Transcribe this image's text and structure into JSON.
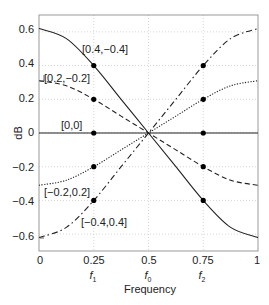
{
  "chart_data": {
    "type": "line",
    "title": "",
    "xlabel": "Frequency",
    "ylabel": "dB",
    "xlim": [
      0,
      1
    ],
    "ylim": [
      -0.7,
      0.7
    ],
    "grid": true,
    "x_ticks": [
      {
        "value": 0,
        "label": "0",
        "sublabel": ""
      },
      {
        "value": 0.25,
        "label": "0.25",
        "sublabel": "f1"
      },
      {
        "value": 0.5,
        "label": "0.5",
        "sublabel": "f0"
      },
      {
        "value": 0.75,
        "label": "0.75",
        "sublabel": "f2"
      },
      {
        "value": 1,
        "label": "1",
        "sublabel": ""
      }
    ],
    "y_ticks": [
      {
        "value": 0.6,
        "label": "0.6"
      },
      {
        "value": 0.4,
        "label": "0.4"
      },
      {
        "value": 0.2,
        "label": "0.2"
      },
      {
        "value": 0,
        "label": "0"
      },
      {
        "value": -0.2,
        "label": "−0.2"
      },
      {
        "value": -0.4,
        "label": "−0.4"
      },
      {
        "value": -0.6,
        "label": "−0.6"
      }
    ],
    "x": [
      0,
      0.125,
      0.25,
      0.375,
      0.5,
      0.625,
      0.75,
      0.875,
      1
    ],
    "series": [
      {
        "name": "[0.4,−0.4]",
        "style": "solid",
        "values": [
          0.62,
          0.56,
          0.4,
          0.2,
          0,
          -0.2,
          -0.4,
          -0.56,
          -0.62
        ],
        "markers": [
          [
            0.25,
            0.4
          ],
          [
            0.75,
            -0.4
          ]
        ],
        "label_pos": [
          0.31,
          0.565
        ]
      },
      {
        "name": "[0.2,−0.2]",
        "style": "dashed",
        "values": [
          0.31,
          0.28,
          0.2,
          0.1,
          0,
          -0.1,
          -0.2,
          -0.28,
          -0.31
        ],
        "markers": [
          [
            0.25,
            0.2
          ],
          [
            0.75,
            -0.2
          ]
        ],
        "label_pos": [
          0.06,
          0.29
        ]
      },
      {
        "name": "[0,0]",
        "style": "solid",
        "values": [
          0,
          0,
          0,
          0,
          0,
          0,
          0,
          0,
          0
        ],
        "markers": [
          [
            0.25,
            0
          ],
          [
            0.75,
            0
          ]
        ],
        "label_pos": [
          0.24,
          0.04
        ]
      },
      {
        "name": "[−0.2,0.2]",
        "style": "dotted",
        "values": [
          -0.31,
          -0.28,
          -0.2,
          -0.1,
          0,
          0.1,
          0.2,
          0.28,
          0.31
        ],
        "markers": [
          [
            0.25,
            -0.2
          ],
          [
            0.75,
            0.2
          ]
        ],
        "label_pos": [
          0.06,
          -0.3
        ]
      },
      {
        "name": "[−0.4,0.4]",
        "style": "dashdot",
        "values": [
          -0.62,
          -0.56,
          -0.4,
          -0.2,
          0,
          0.2,
          0.4,
          0.56,
          0.62
        ],
        "markers": [
          [
            0.25,
            -0.4
          ],
          [
            0.75,
            0.4
          ]
        ],
        "label_pos": [
          0.46,
          -0.5
        ]
      }
    ],
    "legend": "none (inline labels)"
  },
  "labels": {
    "xlabel": "Frequency",
    "ylabel": "dB",
    "s0": "[0.4,−0.4]",
    "s1": "[0.2,−0.2]",
    "s2": "[0,0]",
    "s3": "[−0.2,0.2]",
    "s4": "[−0.4,0.4]",
    "xt0": "0",
    "xt1": "0.25",
    "xt2": "0.5",
    "xt3": "0.75",
    "xt4": "1",
    "yt0": "0.6",
    "yt1": "0.4",
    "yt2": "0.2",
    "yt3": "0",
    "yt4": "−0.2",
    "yt5": "−0.4",
    "yt6": "−0.6",
    "f1": "f",
    "f1sub": "1",
    "f0": "f",
    "f0sub": "0",
    "f2": "f",
    "f2sub": "2"
  }
}
